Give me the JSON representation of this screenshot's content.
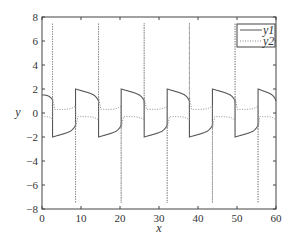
{
  "chart_data": {
    "type": "line",
    "title": "",
    "xlabel": "x",
    "ylabel": "y",
    "xlim": [
      0,
      60
    ],
    "ylim": [
      -8,
      8
    ],
    "xticks": [
      0,
      10,
      20,
      30,
      40,
      50,
      60
    ],
    "yticks": [
      -8,
      -6,
      -4,
      -2,
      0,
      2,
      4,
      6,
      8
    ],
    "xtick_labels": [
      "0",
      "10",
      "20",
      "30",
      "40",
      "50",
      "60"
    ],
    "ytick_labels": [
      "−8",
      "−6",
      "−4",
      "−2",
      "0",
      "2",
      "4",
      "6",
      "8"
    ],
    "grid": false,
    "legend_position": "upper right",
    "series": [
      {
        "name": "y1",
        "style": "solid",
        "color": "#555555",
        "description": "relaxation oscillation between about +2 and -2, period about 11.7",
        "initial_value": 1.5,
        "amplitude": 2.0,
        "transitions_x": [
          2.7,
          8.6,
          14.5,
          20.3,
          26.2,
          32.1,
          37.8,
          43.7,
          49.5,
          55.4
        ]
      },
      {
        "name": "y2",
        "style": "dotted",
        "color": "#888888",
        "description": "derivative-like signal, near +/-0.5 between spikes reaching about +/-7.5 at each y1 transition",
        "baseline_amplitude": 0.5,
        "spike_amplitude": 7.5,
        "transitions_x": [
          2.7,
          8.6,
          14.5,
          20.3,
          26.2,
          32.1,
          37.8,
          43.7,
          49.5,
          55.4
        ]
      }
    ]
  },
  "legend": {
    "items": [
      {
        "label": "y1"
      },
      {
        "label": "y2"
      }
    ]
  }
}
